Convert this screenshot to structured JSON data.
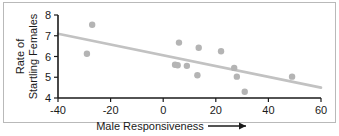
{
  "figure": {
    "frame_color": "#b9b9b9",
    "background": "#ffffff"
  },
  "chart_data": {
    "type": "scatter",
    "title": "",
    "xlabel": "Male Responsiveness",
    "ylabel": "Rate of Startling Females",
    "ylabel_line1": "Rate of",
    "ylabel_line2": "Startling Females",
    "xlabel_has_arrow": true,
    "xlim": [
      -40,
      60
    ],
    "ylim": [
      4,
      8
    ],
    "xticks": [
      -40,
      -20,
      0,
      20,
      40,
      60
    ],
    "xtick_labels": [
      "-40",
      "-20",
      "0",
      "20",
      "40",
      "60"
    ],
    "yticks": [
      4,
      5,
      6,
      7,
      8
    ],
    "ytick_labels": [
      "4",
      "5",
      "6",
      "7",
      "8"
    ],
    "grid": false,
    "legend": null,
    "point_color": "#b4b4b4",
    "point_radius": 3.2,
    "x": [
      -29,
      -27,
      4.5,
      5.5,
      6,
      9,
      13,
      13.5,
      22,
      27,
      28,
      31,
      49
    ],
    "y": [
      6.13,
      7.53,
      5.6,
      5.58,
      6.67,
      5.55,
      5.1,
      6.42,
      6.25,
      5.45,
      5.03,
      4.3,
      5.03
    ],
    "points": [
      {
        "x": -29,
        "y": 6.13
      },
      {
        "x": -27,
        "y": 7.53
      },
      {
        "x": 4.5,
        "y": 5.6
      },
      {
        "x": 5.5,
        "y": 5.58
      },
      {
        "x": 6,
        "y": 6.67
      },
      {
        "x": 9,
        "y": 5.55
      },
      {
        "x": 13,
        "y": 5.1
      },
      {
        "x": 13.5,
        "y": 6.42
      },
      {
        "x": 22,
        "y": 6.25
      },
      {
        "x": 27,
        "y": 5.45
      },
      {
        "x": 28,
        "y": 5.03
      },
      {
        "x": 31,
        "y": 4.3
      },
      {
        "x": 49,
        "y": 5.03
      }
    ],
    "trendline": {
      "type": "line",
      "color": "#c2c2c2",
      "x0": -40,
      "y0": 7.1,
      "x1": 60,
      "y1": 4.5
    }
  }
}
